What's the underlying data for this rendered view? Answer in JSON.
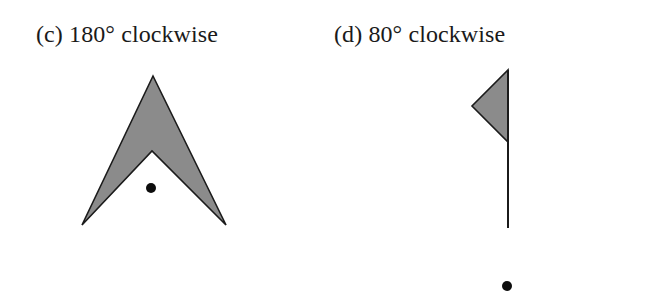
{
  "figure": {
    "background_color": "#ffffff",
    "shape_fill_color": "#8b8b8b",
    "shape_outline_color": "#1b1b1b",
    "dot_color": "#0d0d0d",
    "text_color": "#1a1a1a"
  },
  "panels": [
    {
      "id": "c",
      "caption": "(c) 180° clockwise",
      "label": "(c)",
      "angle": "180°",
      "direction": "clockwise",
      "shape_name": "chevron-arrowhead",
      "shape_points": "153,76 226,225 152,151 82,225",
      "center_of_rotation": {
        "x": 151,
        "y": 188,
        "radius": 5
      }
    },
    {
      "id": "d",
      "caption": "(d) 80° clockwise",
      "label": "(d)",
      "angle": "80°",
      "direction": "clockwise",
      "shape_name": "flag",
      "shape_points": "184,70 184,142 148,106",
      "pole": {
        "x": 184,
        "y1": 70,
        "y2": 228
      },
      "center_of_rotation": {
        "x": 183,
        "y": 286,
        "radius": 5
      }
    }
  ]
}
